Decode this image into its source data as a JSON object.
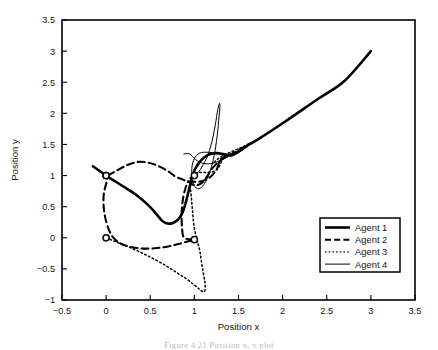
{
  "figure": {
    "caption": "Figure 4.21  Position x, y plot"
  },
  "chart_data": {
    "type": "line",
    "title": "",
    "xlabel": "Position x",
    "ylabel": "Position y",
    "xlim": [
      -0.5,
      3.5
    ],
    "ylim": [
      -1,
      3.5
    ],
    "xticks": [
      -0.5,
      0,
      0.5,
      1,
      1.5,
      2,
      2.5,
      3,
      3.5
    ],
    "xticklabels": [
      "−0.5",
      "0",
      "0.5",
      "1",
      "1.5",
      "2",
      "2.5",
      "3",
      "3.5"
    ],
    "yticks": [
      -1,
      -0.5,
      0,
      0.5,
      1,
      1.5,
      2,
      2.5,
      3,
      3.5
    ],
    "yticklabels": [
      "−1",
      "−0.5",
      "0",
      "0.5",
      "1",
      "1.5",
      "2",
      "2.5",
      "3",
      "3.5"
    ],
    "grid": false,
    "legend_position": "lower right",
    "series": [
      {
        "name": "Agent 1",
        "style": "solid",
        "linewidth": 2.6,
        "dash": "none",
        "start_marker": [
          0,
          1
        ],
        "points": [
          [
            -0.15,
            1.15
          ],
          [
            0.0,
            1.0
          ],
          [
            0.2,
            0.82
          ],
          [
            0.35,
            0.68
          ],
          [
            0.48,
            0.52
          ],
          [
            0.57,
            0.38
          ],
          [
            0.63,
            0.28
          ],
          [
            0.68,
            0.235
          ],
          [
            0.75,
            0.235
          ],
          [
            0.82,
            0.3
          ],
          [
            0.87,
            0.42
          ],
          [
            0.905,
            0.58
          ],
          [
            0.935,
            0.75
          ],
          [
            0.965,
            0.92
          ],
          [
            1.0,
            1.08
          ],
          [
            1.05,
            1.2
          ],
          [
            1.11,
            1.29
          ],
          [
            1.18,
            1.345
          ],
          [
            1.26,
            1.36
          ],
          [
            1.33,
            1.345
          ],
          [
            1.4,
            1.33
          ],
          [
            1.47,
            1.36
          ],
          [
            1.54,
            1.42
          ],
          [
            1.62,
            1.5
          ],
          [
            1.72,
            1.58
          ],
          [
            2.0,
            1.84
          ],
          [
            2.4,
            2.23
          ],
          [
            2.7,
            2.52
          ],
          [
            3.0,
            3.0
          ]
        ]
      },
      {
        "name": "Agent 2",
        "style": "dashed",
        "linewidth": 2.1,
        "dash": "7,4",
        "start_marker": [
          0,
          1
        ],
        "points": [
          [
            0.02,
            1.0
          ],
          [
            0.12,
            1.08
          ],
          [
            0.24,
            1.17
          ],
          [
            0.36,
            1.22
          ],
          [
            0.47,
            1.21
          ],
          [
            0.58,
            1.16
          ],
          [
            0.69,
            1.08
          ],
          [
            0.78,
            0.99
          ],
          [
            0.86,
            0.94
          ],
          [
            0.93,
            0.91
          ],
          [
            1.0,
            0.9
          ],
          [
            1.07,
            0.905
          ],
          [
            1.13,
            0.935
          ],
          [
            1.19,
            0.99
          ],
          [
            1.235,
            1.06
          ],
          [
            1.265,
            1.14
          ],
          [
            1.28,
            1.21
          ],
          [
            1.3,
            1.26
          ],
          [
            1.34,
            1.3
          ],
          [
            1.4,
            1.31
          ],
          [
            1.47,
            1.355
          ],
          [
            1.54,
            1.42
          ],
          [
            1.6,
            1.48
          ],
          [
            1.5,
            1.41
          ],
          [
            1.4,
            1.33
          ],
          [
            1.31,
            1.255
          ],
          [
            1.24,
            1.175
          ],
          [
            1.19,
            1.09
          ],
          [
            1.15,
            1.0
          ],
          [
            1.11,
            0.92
          ],
          [
            1.07,
            0.865
          ],
          [
            1.02,
            0.845
          ],
          [
            0.97,
            0.86
          ],
          [
            0.93,
            0.9
          ],
          [
            0.9,
            0.8
          ],
          [
            0.875,
            0.66
          ],
          [
            0.86,
            0.5
          ],
          [
            0.855,
            0.33
          ],
          [
            0.86,
            0.17
          ],
          [
            0.87,
            0.04
          ],
          [
            0.9,
            -0.01
          ],
          [
            0.95,
            -0.025
          ],
          [
            1.0,
            -0.03
          ],
          [
            0.92,
            -0.06
          ],
          [
            0.82,
            -0.1
          ],
          [
            0.7,
            -0.14
          ],
          [
            0.58,
            -0.165
          ],
          [
            0.46,
            -0.175
          ],
          [
            0.35,
            -0.165
          ],
          [
            0.25,
            -0.14
          ],
          [
            0.16,
            -0.09
          ],
          [
            0.09,
            -0.01
          ],
          [
            0.04,
            0.1
          ],
          [
            0.005,
            0.24
          ],
          [
            -0.02,
            0.4
          ],
          [
            -0.03,
            0.56
          ],
          [
            -0.025,
            0.72
          ],
          [
            0.0,
            0.87
          ],
          [
            0.02,
            1.0
          ]
        ]
      },
      {
        "name": "Agent 3",
        "style": "dotted",
        "linewidth": 1.5,
        "dash": "1.6,2.6",
        "start_marker": [
          0,
          0
        ],
        "points": [
          [
            0.0,
            0.0
          ],
          [
            0.12,
            -0.07
          ],
          [
            0.26,
            -0.15
          ],
          [
            0.4,
            -0.24
          ],
          [
            0.54,
            -0.34
          ],
          [
            0.68,
            -0.45
          ],
          [
            0.8,
            -0.56
          ],
          [
            0.91,
            -0.66
          ],
          [
            1.0,
            -0.76
          ],
          [
            1.06,
            -0.83
          ],
          [
            1.1,
            -0.87
          ],
          [
            1.12,
            -0.84
          ],
          [
            1.12,
            -0.72
          ],
          [
            1.1,
            -0.56
          ],
          [
            1.08,
            -0.38
          ],
          [
            1.06,
            -0.2
          ],
          [
            1.03,
            -0.03
          ],
          [
            1.0,
            0.15
          ],
          [
            0.985,
            0.33
          ],
          [
            0.975,
            0.5
          ],
          [
            0.965,
            0.66
          ],
          [
            0.955,
            0.8
          ],
          [
            0.95,
            0.92
          ],
          [
            0.97,
            1.0
          ],
          [
            1.02,
            1.04
          ],
          [
            1.08,
            1.05
          ],
          [
            1.14,
            1.05
          ],
          [
            1.2,
            1.06
          ],
          [
            1.25,
            1.09
          ],
          [
            1.28,
            1.14
          ],
          [
            1.3,
            1.2
          ],
          [
            1.315,
            1.26
          ],
          [
            1.34,
            1.3
          ],
          [
            1.38,
            1.325
          ],
          [
            1.43,
            1.345
          ],
          [
            1.48,
            1.38
          ],
          [
            1.53,
            1.42
          ],
          [
            1.58,
            1.47
          ],
          [
            1.63,
            1.52
          ],
          [
            1.56,
            1.47
          ],
          [
            1.48,
            1.42
          ],
          [
            1.41,
            1.375
          ],
          [
            1.35,
            1.34
          ],
          [
            1.3,
            1.3
          ],
          [
            1.26,
            1.26
          ],
          [
            1.22,
            1.21
          ]
        ]
      },
      {
        "name": "Agent 4",
        "style": "solid-thin",
        "linewidth": 1.0,
        "dash": "none",
        "start_marker": [
          1,
          1
        ],
        "points": [
          [
            1.0,
            1.0
          ],
          [
            1.035,
            1.04
          ],
          [
            1.07,
            1.1
          ],
          [
            1.1,
            1.18
          ],
          [
            1.14,
            1.28
          ],
          [
            1.17,
            1.4
          ],
          [
            1.2,
            1.55
          ],
          [
            1.225,
            1.72
          ],
          [
            1.245,
            1.88
          ],
          [
            1.26,
            2.02
          ],
          [
            1.275,
            2.12
          ],
          [
            1.285,
            2.16
          ],
          [
            1.29,
            2.13
          ],
          [
            1.285,
            2.02
          ],
          [
            1.275,
            1.88
          ],
          [
            1.265,
            1.72
          ],
          [
            1.25,
            1.55
          ],
          [
            1.235,
            1.4
          ],
          [
            1.215,
            1.26
          ],
          [
            1.195,
            1.15
          ],
          [
            1.175,
            1.06
          ],
          [
            1.155,
            0.98
          ],
          [
            1.13,
            0.91
          ],
          [
            1.105,
            0.85
          ],
          [
            1.08,
            0.81
          ],
          [
            1.05,
            0.79
          ],
          [
            1.02,
            0.8
          ],
          [
            1.0,
            0.84
          ],
          [
            0.985,
            0.9
          ],
          [
            0.975,
            0.98
          ],
          [
            0.97,
            1.07
          ],
          [
            0.975,
            1.16
          ],
          [
            0.99,
            1.24
          ],
          [
            1.01,
            1.3
          ],
          [
            1.04,
            1.345
          ],
          [
            1.08,
            1.37
          ],
          [
            1.13,
            1.375
          ],
          [
            1.19,
            1.37
          ],
          [
            1.25,
            1.355
          ],
          [
            1.31,
            1.335
          ],
          [
            1.37,
            1.32
          ],
          [
            1.43,
            1.335
          ],
          [
            1.49,
            1.37
          ],
          [
            1.55,
            1.42
          ],
          [
            1.61,
            1.48
          ],
          [
            1.67,
            1.54
          ],
          [
            1.59,
            1.47
          ],
          [
            1.51,
            1.4
          ],
          [
            1.44,
            1.345
          ],
          [
            1.37,
            1.295
          ],
          [
            1.3,
            1.25
          ],
          [
            1.24,
            1.21
          ],
          [
            1.18,
            1.19
          ],
          [
            1.12,
            1.19
          ],
          [
            1.06,
            1.215
          ],
          [
            1.01,
            1.26
          ],
          [
            0.975,
            1.31
          ],
          [
            0.95,
            1.345
          ],
          [
            0.92,
            1.355
          ],
          [
            0.88,
            1.345
          ]
        ]
      }
    ],
    "markers": [
      {
        "label": "agent-1-start",
        "x": 0,
        "y": 1
      },
      {
        "label": "agent-2-start",
        "x": 0,
        "y": 1
      },
      {
        "label": "agent-3-start",
        "x": 0,
        "y": 0
      },
      {
        "label": "agent-4-start",
        "x": 1,
        "y": 1
      },
      {
        "label": "agent-2-waypoint",
        "x": 1,
        "y": -0.03
      }
    ]
  },
  "legend": {
    "entries": [
      {
        "label": "Agent 1",
        "style": "solid",
        "linewidth": 2.6,
        "dash": "none"
      },
      {
        "label": "Agent 2",
        "style": "dashed",
        "linewidth": 2.1,
        "dash": "6,3.2"
      },
      {
        "label": "Agent 3",
        "style": "dotted",
        "linewidth": 1.4,
        "dash": "1.5,2.2"
      },
      {
        "label": "Agent 4",
        "style": "solid-thin",
        "linewidth": 1.0,
        "dash": "none"
      }
    ]
  }
}
